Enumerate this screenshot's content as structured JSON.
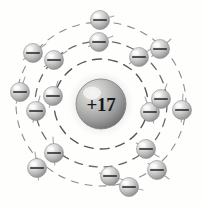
{
  "diagram": {
    "nucleus": {
      "label": "+17",
      "charge": 17,
      "element": "chlorine",
      "center_x": 101,
      "center_y": 104,
      "radius": 25,
      "fill_light": "#d8d8d6",
      "fill_dark": "#7b7b7c",
      "text_color": "#17171a"
    },
    "colors": {
      "background": "#fefefd",
      "ring_outer": "#8d8d90",
      "ring_middle": "#6a6a6d",
      "ring_inner": "#56565a",
      "electron_light": "#f3f3f2",
      "electron_mid": "#c9c9c8",
      "electron_dark": "#8e8e90",
      "electron_sign": "#212124",
      "stick": "#a9a9ac"
    },
    "shells": [
      {
        "name": "shell-1-inner",
        "index": 1,
        "electron_count": 2,
        "radius_x": 47,
        "radius_y": 45,
        "ring_class": "inner"
      },
      {
        "name": "shell-2-middle",
        "index": 2,
        "electron_count": 8,
        "radius_x": 66,
        "radius_y": 63,
        "ring_class": "middle"
      },
      {
        "name": "shell-3-outer",
        "index": 3,
        "electron_count": 7,
        "radius_x": 85,
        "radius_y": 82,
        "ring_class": "outer"
      }
    ],
    "electron_symbol": "minus-sign",
    "electron_radius": 9.5,
    "electrons": [
      {
        "id": "e1",
        "shell": 1,
        "cx": 53,
        "cy": 96,
        "stick_dx": 5,
        "stick_dy": -15
      },
      {
        "id": "e2",
        "shell": 1,
        "cx": 150,
        "cy": 112,
        "stick_dx": -5,
        "stick_dy": -15
      },
      {
        "id": "e3",
        "shell": 2,
        "cx": 99,
        "cy": 42,
        "stick_dx": 14,
        "stick_dy": -6
      },
      {
        "id": "e4",
        "shell": 2,
        "cx": 139,
        "cy": 57,
        "stick_dx": 13,
        "stick_dy": -9
      },
      {
        "id": "e5",
        "shell": 2,
        "cx": 161,
        "cy": 99,
        "stick_dx": 6,
        "stick_dy": -15
      },
      {
        "id": "e6",
        "shell": 2,
        "cx": 146,
        "cy": 149,
        "stick_dx": 13,
        "stick_dy": 8
      },
      {
        "id": "e7",
        "shell": 2,
        "cx": 110,
        "cy": 176,
        "stick_dx": 14,
        "stick_dy": 4
      },
      {
        "id": "e8",
        "shell": 2,
        "cx": 54,
        "cy": 153,
        "stick_dx": -1,
        "stick_dy": -16
      },
      {
        "id": "e9",
        "shell": 2,
        "cx": 36,
        "cy": 111,
        "stick_dx": 4,
        "stick_dy": -15
      },
      {
        "id": "e10",
        "shell": 2,
        "cx": 54,
        "cy": 60,
        "stick_dx": 13,
        "stick_dy": -9
      },
      {
        "id": "e11",
        "shell": 3,
        "cx": 100,
        "cy": 20,
        "stick_dx": 14,
        "stick_dy": -4
      },
      {
        "id": "e12",
        "shell": 3,
        "cx": 160,
        "cy": 49,
        "stick_dx": 11,
        "stick_dy": -10
      },
      {
        "id": "e13",
        "shell": 3,
        "cx": 182,
        "cy": 110,
        "stick_dx": 1,
        "stick_dy": -16
      },
      {
        "id": "e14",
        "shell": 3,
        "cx": 157,
        "cy": 170,
        "stick_dx": 12,
        "stick_dy": 9
      },
      {
        "id": "e15",
        "shell": 3,
        "cx": 129,
        "cy": 187,
        "stick_dx": 14,
        "stick_dy": 3
      },
      {
        "id": "e16",
        "shell": 3,
        "cx": 37,
        "cy": 168,
        "stick_dx": -2,
        "stick_dy": -16
      },
      {
        "id": "e17",
        "shell": 3,
        "cx": 20,
        "cy": 92,
        "stick_dx": 5,
        "stick_dy": -15
      },
      {
        "id": "e18",
        "shell": 3,
        "cx": 33,
        "cy": 53,
        "stick_dx": 13,
        "stick_dy": -9
      }
    ]
  }
}
